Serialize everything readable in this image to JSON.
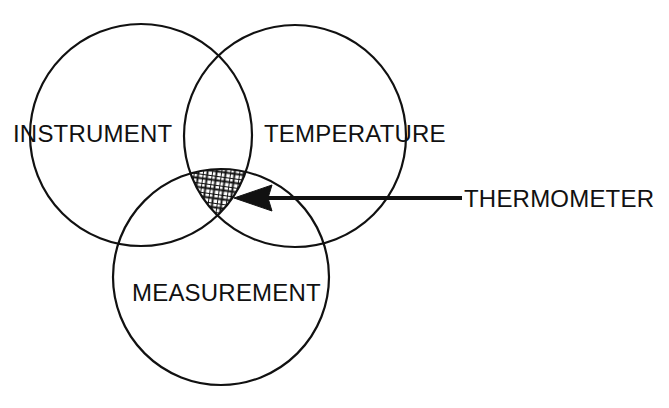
{
  "diagram": {
    "type": "venn-3-set",
    "title": "",
    "background_color": "#ffffff",
    "stroke_color": "#111111",
    "stroke_width": 2.2,
    "sets": [
      {
        "id": "instrument",
        "label": "INSTRUMENT",
        "label_x": 13,
        "label_y": 142,
        "cx": 141,
        "cy": 135,
        "r": 111
      },
      {
        "id": "temperature",
        "label": "TEMPERATURE",
        "label_x": 264,
        "label_y": 142,
        "cx": 295,
        "cy": 136,
        "r": 111
      },
      {
        "id": "measurement",
        "label": "MEASUREMENT",
        "label_x": 132,
        "label_y": 301,
        "cx": 221,
        "cy": 277,
        "r": 108
      }
    ],
    "intersection": {
      "id": "triple-intersection",
      "fill_pattern": "crosshatch",
      "pattern_color": "#111111",
      "description": "triple overlap region of instrument, temperature and measurement"
    },
    "callout": {
      "id": "thermometer-callout",
      "label": "THERMOMETER",
      "label_x": 464,
      "label_y": 207,
      "arrow_tip_x": 234,
      "arrow_tip_y": 198,
      "arrow_tail_x": 462,
      "arrow_tail_y": 198,
      "arrow_color": "#111111",
      "points_to": "triple-intersection"
    }
  }
}
